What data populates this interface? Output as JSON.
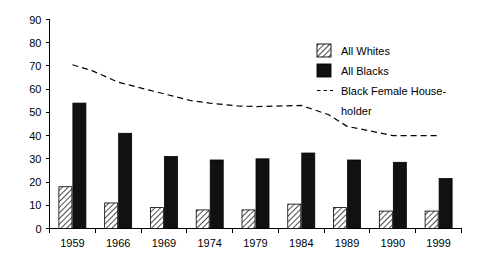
{
  "chart_data": {
    "type": "bar",
    "title": "",
    "xlabel": "",
    "ylabel": "",
    "categories": [
      "1959",
      "1966",
      "1969",
      "1974",
      "1979",
      "1984",
      "1989",
      "1990",
      "1999"
    ],
    "ylim": [
      0,
      90
    ],
    "ytick_values": [
      0,
      10,
      20,
      30,
      40,
      50,
      60,
      70,
      80,
      90
    ],
    "ytick_labels": [
      "0",
      "10",
      "20",
      "30",
      "40",
      "50",
      "60",
      "70",
      "80",
      "90"
    ],
    "grid": false,
    "legend_position": "upper-right",
    "series": [
      {
        "name": "All Whites",
        "style": "bar-hatched",
        "values": [
          18,
          11,
          9,
          8,
          8,
          10.5,
          9,
          7.5,
          7.5
        ]
      },
      {
        "name": "All Blacks",
        "style": "bar-solid-black",
        "values": [
          54,
          41,
          31,
          29.5,
          30,
          32.5,
          29.5,
          28.5,
          21.5
        ]
      },
      {
        "name": "Black Female House-holder",
        "style": "dashed-line",
        "values": [
          70.5,
          63,
          58,
          54,
          52.5,
          53,
          48,
          40,
          40
        ]
      }
    ],
    "line_points": [
      {
        "x": "1959",
        "y": 70.5
      },
      {
        "x": "1962",
        "y": 68
      },
      {
        "x": "1966",
        "y": 63
      },
      {
        "x": "1969",
        "y": 58
      },
      {
        "x": "1972",
        "y": 55
      },
      {
        "x": "1974",
        "y": 54
      },
      {
        "x": "1977",
        "y": 52.8
      },
      {
        "x": "1979",
        "y": 52.5
      },
      {
        "x": "1982",
        "y": 52.8
      },
      {
        "x": "1984",
        "y": 53
      },
      {
        "x": "1987",
        "y": 49
      },
      {
        "x": "1989",
        "y": 44
      },
      {
        "x": "1990",
        "y": 40
      },
      {
        "x": "1995",
        "y": 40
      },
      {
        "x": "1999",
        "y": 40
      }
    ]
  },
  "legend": {
    "items": [
      {
        "label": "All Whites",
        "marker": "hatched-square-swatch"
      },
      {
        "label": "All Blacks",
        "marker": "black-square-swatch"
      },
      {
        "label": "Black Female House-",
        "marker": "dashed-line-swatch"
      },
      {
        "label": "holder",
        "marker": "none"
      }
    ]
  },
  "colors": {
    "axis": "#000000",
    "bar_black": "#111111",
    "bar_white_fill": "#ffffff",
    "hatch": "#000000",
    "background": "#ffffff"
  }
}
